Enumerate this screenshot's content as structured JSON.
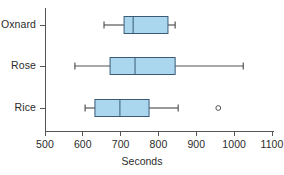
{
  "chart_data": {
    "type": "boxplot",
    "title": "",
    "xlabel": "Seconds",
    "ylabel": "",
    "orientation": "horizontal",
    "xlim": [
      460,
      1140
    ],
    "xticks": [
      500,
      600,
      700,
      800,
      900,
      1000,
      1100
    ],
    "xtick_labels": [
      "500",
      "600",
      "700",
      "800",
      "900",
      "1000",
      "1100"
    ],
    "grid": false,
    "legend": null,
    "categories": [
      "Oxnard",
      "Rose",
      "Rice"
    ],
    "box_fill_color": "#AAD6EE",
    "box_line_color": "#3A5A78",
    "whisker_color": "#555555",
    "axis_color": "#555555",
    "boxes": [
      {
        "category": "Oxnard",
        "whisker_low": 656,
        "q1": 709,
        "median": 733,
        "q3": 825,
        "whisker_high": 844,
        "outliers": []
      },
      {
        "category": "Rose",
        "whisker_low": 579,
        "q1": 672,
        "median": 738,
        "q3": 844,
        "whisker_high": 1024,
        "outliers": []
      },
      {
        "category": "Rice",
        "whisker_low": 606,
        "q1": 632,
        "median": 698,
        "q3": 775,
        "whisker_high": 852,
        "outliers": [
          958
        ]
      }
    ]
  },
  "axis": {
    "x_title": "Seconds",
    "tick_labels": [
      "500",
      "600",
      "700",
      "800",
      "900",
      "1000",
      "1100"
    ],
    "category_labels": [
      "Oxnard",
      "Rose",
      "Rice"
    ]
  }
}
